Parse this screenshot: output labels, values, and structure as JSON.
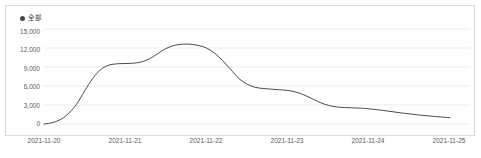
{
  "legend": {
    "marker_icon": "legend-dot-icon",
    "label": "全部",
    "color": "#4a4a4a"
  },
  "axis": {
    "y_ticks": [
      "15,000",
      "12,000",
      "9,000",
      "6,000",
      "3,000",
      "0"
    ],
    "x_ticks": [
      "2021-11-20",
      "2021-11-21",
      "2021-11-22",
      "2021-11-23",
      "2021-11-24",
      "2021-11-25"
    ]
  },
  "chart_data": {
    "type": "line",
    "title": "",
    "xlabel": "",
    "ylabel": "",
    "ylim": [
      0,
      15000
    ],
    "yticks": [
      0,
      3000,
      6000,
      9000,
      12000,
      15000
    ],
    "grid": true,
    "legend_position": "top-left",
    "line_color": "#4a4a4a",
    "line_width": 1,
    "smooth": true,
    "x": [
      "2021-11-20",
      "2021-11-21",
      "2021-11-22",
      "2021-11-23",
      "2021-11-24",
      "2021-11-25"
    ],
    "series": [
      {
        "name": "全部",
        "values": [
          0,
          9500,
          12600,
          5600,
          2600,
          1000
        ]
      }
    ],
    "dense_x": [
      0.0,
      0.08,
      0.16,
      0.24,
      0.32,
      0.4,
      0.5,
      0.6,
      0.7,
      0.8,
      0.9,
      1.0,
      1.1,
      1.2,
      1.3,
      1.4,
      1.5,
      1.6,
      1.7,
      1.8,
      1.9,
      2.0,
      2.1,
      2.2,
      2.3,
      2.4,
      2.5,
      2.6,
      2.7,
      2.8,
      2.9,
      3.0,
      3.1,
      3.2,
      3.3,
      3.4,
      3.5,
      3.6,
      3.7,
      3.8,
      3.9,
      4.0,
      4.2,
      4.4,
      4.6,
      4.8,
      5.0
    ],
    "dense_y": [
      0,
      150,
      450,
      1000,
      1900,
      3100,
      5200,
      7200,
      8600,
      9300,
      9500,
      9550,
      9600,
      9800,
      10300,
      11100,
      11900,
      12400,
      12600,
      12600,
      12400,
      12000,
      11200,
      10000,
      8600,
      7200,
      6300,
      5800,
      5600,
      5500,
      5400,
      5300,
      5050,
      4600,
      4000,
      3400,
      2950,
      2700,
      2600,
      2550,
      2500,
      2400,
      2100,
      1750,
      1450,
      1200,
      1000
    ]
  }
}
